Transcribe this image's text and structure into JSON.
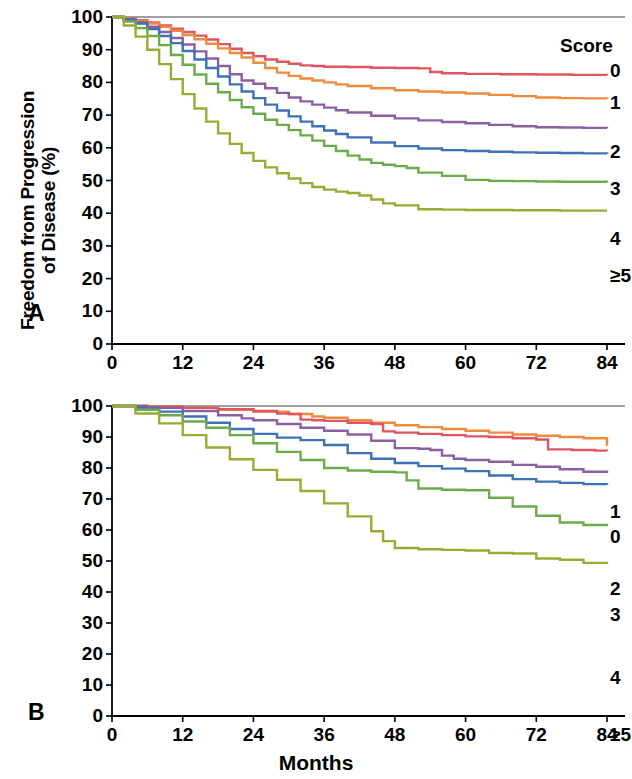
{
  "figure": {
    "x_axis_title": "Months",
    "legend_title": "Score"
  },
  "panels": [
    {
      "letter": "A",
      "y_axis_title_line1": "Freedom from Progression",
      "y_axis_title_line2": "of Disease (%)",
      "y_ticks": [
        "100",
        "90",
        "80",
        "70",
        "60",
        "50",
        "40",
        "30",
        "20",
        "10",
        "0"
      ],
      "x_ticks": [
        "0",
        "12",
        "24",
        "36",
        "48",
        "60",
        "72",
        "84"
      ],
      "legend": [
        "0",
        "1",
        "2",
        "3",
        "4",
        "≥5"
      ]
    },
    {
      "letter": "B",
      "y_axis_title_line1": "Overall Survival (%)",
      "y_axis_title_line2": "",
      "y_ticks": [
        "100",
        "90",
        "80",
        "70",
        "60",
        "50",
        "40",
        "30",
        "20",
        "10",
        "0"
      ],
      "x_ticks": [
        "0",
        "12",
        "24",
        "36",
        "48",
        "60",
        "72",
        "84"
      ],
      "legend": [
        "1",
        "0",
        "2",
        "3",
        "4",
        "≥5"
      ]
    }
  ],
  "colors": {
    "score0": "#e0555f",
    "score1": "#ef8b3c",
    "score2": "#8c5fa0",
    "score3": "#3d72b4",
    "score4": "#6cab4a",
    "score5plus": "#9aab33",
    "axis": "#000000",
    "frame": "#808080"
  },
  "chart_data": [
    {
      "type": "line",
      "title": "Freedom from Progression of Disease by Score",
      "xlabel": "Months",
      "ylabel": "Freedom from Progression of Disease (%)",
      "xlim": [
        0,
        84
      ],
      "ylim": [
        0,
        100
      ],
      "xticks": [
        0,
        12,
        24,
        36,
        48,
        60,
        72,
        84
      ],
      "yticks": [
        0,
        10,
        20,
        30,
        40,
        50,
        60,
        70,
        80,
        90,
        100
      ],
      "grid": false,
      "legend_position": "right",
      "step": "post",
      "series": [
        {
          "name": "0",
          "color": "#e0555f",
          "x": [
            0,
            2,
            4,
            6,
            8,
            10,
            12,
            14,
            16,
            18,
            20,
            22,
            24,
            26,
            28,
            30,
            32,
            34,
            36,
            40,
            44,
            48,
            52,
            54,
            56,
            60,
            66,
            72,
            78,
            84
          ],
          "y": [
            100,
            99.6,
            99,
            98.3,
            97.4,
            96.4,
            95.4,
            94.3,
            93.1,
            91.7,
            90.3,
            89,
            88,
            87,
            86.3,
            85.7,
            85.2,
            85,
            84.8,
            84.7,
            84.5,
            84.4,
            84.3,
            83.2,
            82.8,
            82.6,
            82.5,
            82.4,
            82.3,
            82.2
          ]
        },
        {
          "name": "1",
          "color": "#ef8b3c",
          "x": [
            0,
            2,
            4,
            6,
            8,
            10,
            12,
            14,
            16,
            18,
            20,
            22,
            24,
            26,
            28,
            30,
            32,
            34,
            36,
            38,
            40,
            44,
            48,
            52,
            56,
            60,
            64,
            68,
            72,
            76,
            80,
            84
          ],
          "y": [
            100,
            99.5,
            98.8,
            98,
            97,
            95.8,
            94.5,
            93.2,
            91.8,
            90.4,
            89,
            87.6,
            86,
            84.4,
            83,
            82,
            81.2,
            80.6,
            80,
            79.4,
            78.9,
            78.2,
            77.6,
            77.2,
            76.9,
            76.6,
            76.2,
            75.8,
            75.4,
            75.2,
            75.1,
            75.0
          ]
        },
        {
          "name": "2",
          "color": "#8c5fa0",
          "x": [
            0,
            2,
            4,
            6,
            8,
            10,
            12,
            14,
            16,
            18,
            20,
            22,
            24,
            26,
            28,
            30,
            32,
            34,
            36,
            38,
            40,
            44,
            48,
            52,
            56,
            60,
            64,
            68,
            72,
            76,
            80,
            84
          ],
          "y": [
            100,
            99.3,
            98.3,
            97,
            95.4,
            93.6,
            91.6,
            89.5,
            87.3,
            85,
            82.5,
            80.6,
            79.6,
            78.2,
            76.8,
            75.4,
            74.2,
            73.2,
            72.3,
            71.5,
            70.8,
            69.8,
            69,
            68.4,
            67.9,
            67.5,
            67,
            66.6,
            66.3,
            66.2,
            66.1,
            66.0
          ]
        },
        {
          "name": "3",
          "color": "#3d72b4",
          "x": [
            0,
            2,
            4,
            6,
            8,
            10,
            12,
            14,
            16,
            18,
            20,
            22,
            24,
            26,
            28,
            30,
            32,
            34,
            36,
            38,
            40,
            44,
            48,
            52,
            56,
            60,
            64,
            68,
            72,
            76,
            80,
            84
          ],
          "y": [
            100,
            99.2,
            98,
            96.3,
            94.2,
            92,
            89.6,
            87,
            84.4,
            81.8,
            79.4,
            77.2,
            75.2,
            73.2,
            71.4,
            69.6,
            68,
            66.6,
            65.3,
            64.2,
            63.2,
            61.6,
            60.5,
            59.8,
            59.3,
            59,
            58.8,
            58.6,
            58.5,
            58.4,
            58.3,
            58.2
          ]
        },
        {
          "name": "4",
          "color": "#6cab4a",
          "x": [
            0,
            2,
            4,
            6,
            8,
            10,
            12,
            14,
            16,
            18,
            20,
            22,
            24,
            26,
            28,
            30,
            32,
            34,
            36,
            38,
            40,
            42,
            44,
            46,
            48,
            50,
            52,
            56,
            60,
            64,
            68,
            72,
            76,
            80,
            84
          ],
          "y": [
            100,
            98.6,
            96.6,
            94.2,
            91.4,
            88.4,
            85.4,
            82.4,
            79.6,
            77,
            74.6,
            72.4,
            70.4,
            68.6,
            67,
            65.4,
            63.8,
            62.2,
            60.6,
            59,
            57.6,
            56.4,
            55.4,
            54.8,
            54.4,
            53.8,
            52.4,
            51.4,
            50.2,
            49.9,
            49.8,
            49.7,
            49.6,
            49.6,
            49.5
          ]
        },
        {
          "name": "≥5",
          "color": "#9aab33",
          "x": [
            0,
            2,
            4,
            6,
            8,
            10,
            12,
            14,
            16,
            18,
            20,
            22,
            24,
            26,
            28,
            30,
            32,
            34,
            36,
            38,
            40,
            42,
            44,
            46,
            48,
            52,
            56,
            60,
            64,
            68,
            72,
            76,
            80,
            84
          ],
          "y": [
            100,
            97.4,
            94,
            90,
            85.6,
            81,
            76.4,
            72,
            68,
            64.4,
            61.2,
            58.4,
            56,
            54,
            52.2,
            50.6,
            49.2,
            48,
            47.2,
            46.6,
            46.2,
            45.4,
            44.2,
            43,
            42.4,
            41.2,
            41.1,
            41.0,
            41.0,
            40.9,
            40.9,
            40.8,
            40.8,
            40.8
          ]
        }
      ]
    },
    {
      "type": "line",
      "title": "Overall Survival by Score",
      "xlabel": "Months",
      "ylabel": "Overall Survival (%)",
      "xlim": [
        0,
        84
      ],
      "ylim": [
        0,
        100
      ],
      "xticks": [
        0,
        12,
        24,
        36,
        48,
        60,
        72,
        84
      ],
      "yticks": [
        0,
        10,
        20,
        30,
        40,
        50,
        60,
        70,
        80,
        90,
        100
      ],
      "grid": false,
      "legend_position": "right",
      "step": "post",
      "series": [
        {
          "name": "1",
          "color": "#ef8b3c",
          "x": [
            0,
            6,
            12,
            18,
            24,
            30,
            34,
            36,
            40,
            44,
            48,
            52,
            56,
            60,
            64,
            68,
            72,
            76,
            80,
            84
          ],
          "y": [
            100,
            99.8,
            99.4,
            98.8,
            98.2,
            97.4,
            96.6,
            96.2,
            95.4,
            94.6,
            93.8,
            93.2,
            92.6,
            92,
            91.4,
            90.8,
            90.4,
            90,
            89.6,
            87.2
          ]
        },
        {
          "name": "0",
          "color": "#e0555f",
          "x": [
            0,
            6,
            12,
            18,
            24,
            28,
            30,
            32,
            34,
            36,
            40,
            44,
            46,
            48,
            52,
            56,
            60,
            64,
            68,
            72,
            74,
            78,
            82,
            84
          ],
          "y": [
            100,
            99.8,
            99.4,
            99,
            98.4,
            97.6,
            97.4,
            95.6,
            95.4,
            95.2,
            94.6,
            94.2,
            91.8,
            91.4,
            91,
            90.6,
            90.2,
            90,
            89.6,
            89.2,
            86,
            85.8,
            85.6,
            85.5
          ]
        },
        {
          "name": "2",
          "color": "#8c5fa0",
          "x": [
            0,
            6,
            12,
            18,
            22,
            24,
            28,
            32,
            36,
            40,
            44,
            48,
            52,
            54,
            56,
            58,
            60,
            64,
            68,
            72,
            76,
            80,
            84
          ],
          "y": [
            100,
            99.4,
            98.4,
            97,
            96,
            95.4,
            94.2,
            93,
            92,
            90.8,
            88.8,
            86.4,
            86.2,
            85.8,
            84,
            83,
            82.6,
            82,
            81,
            80.4,
            79.6,
            78.8,
            78.4
          ]
        },
        {
          "name": "3",
          "color": "#3d72b4",
          "x": [
            0,
            4,
            8,
            12,
            16,
            20,
            24,
            28,
            32,
            36,
            40,
            44,
            48,
            52,
            56,
            60,
            64,
            68,
            72,
            76,
            80,
            84
          ],
          "y": [
            100,
            99.4,
            98.2,
            96.6,
            94.6,
            92.6,
            91,
            89.8,
            89,
            87.4,
            84.8,
            83,
            81.6,
            80.6,
            79.8,
            79,
            77.6,
            76.4,
            75.6,
            75.2,
            74.8,
            74.6
          ]
        },
        {
          "name": "4",
          "color": "#6cab4a",
          "x": [
            0,
            4,
            8,
            12,
            16,
            20,
            24,
            28,
            32,
            36,
            40,
            44,
            48,
            50,
            52,
            56,
            60,
            64,
            68,
            72,
            76,
            80,
            84
          ],
          "y": [
            100,
            98.8,
            97,
            95,
            93,
            90.6,
            88,
            85.2,
            82.6,
            80,
            79.2,
            78.8,
            78.6,
            76,
            73.4,
            73,
            72.8,
            70.4,
            67.6,
            64.6,
            62.4,
            61.6,
            61.2
          ]
        },
        {
          "name": "≥5",
          "color": "#9aab33",
          "x": [
            0,
            4,
            8,
            12,
            16,
            20,
            24,
            28,
            32,
            36,
            40,
            44,
            46,
            48,
            52,
            56,
            60,
            64,
            68,
            72,
            76,
            80,
            84
          ],
          "y": [
            100,
            97.6,
            94.4,
            90.6,
            86.6,
            82.8,
            79.4,
            76.2,
            72.6,
            68.6,
            64.4,
            59.6,
            56.4,
            54.2,
            53.8,
            53.6,
            53.4,
            52.6,
            52.4,
            50.8,
            50.4,
            49.4,
            49.0
          ]
        }
      ]
    }
  ]
}
